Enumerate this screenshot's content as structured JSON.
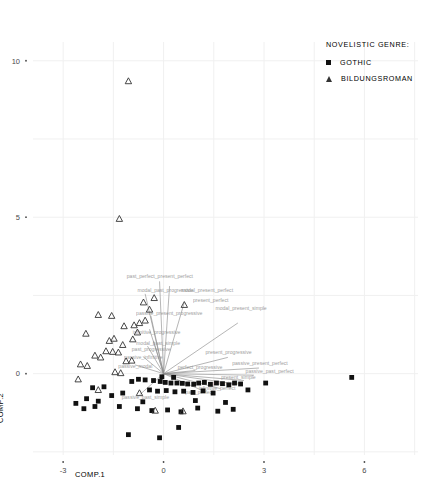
{
  "legend": {
    "title": "NOVELISTIC GENRE:",
    "entries": [
      {
        "label": "GOTHIC",
        "marker": "square-marker",
        "color": "#111111"
      },
      {
        "label": "BILDUNGSROMAN",
        "marker": "triangle-marker",
        "color": "#333333"
      }
    ]
  },
  "axes": {
    "xlabel": "COMP.1",
    "ylabel": "COMP.2",
    "xticks": [
      "-3",
      "0",
      "3",
      "6"
    ],
    "yticks": [
      "0",
      "5",
      "10"
    ]
  },
  "colors": {
    "gothic": "#111111",
    "bildungsroman": "#333333",
    "vector": "#8c8c8c",
    "grid": "#f0f0f0",
    "axis_text": "#4a4a4a"
  },
  "chart_data": {
    "type": "scatter",
    "title": "",
    "subtitle": "",
    "xlabel": "COMP.1",
    "ylabel": "COMP.2",
    "xlim": [
      -3.9,
      7.6
    ],
    "ylim": [
      -2.6,
      10.6
    ],
    "xticks": [
      -3,
      0,
      3,
      6
    ],
    "yticks": [
      0,
      5,
      10
    ],
    "grid": true,
    "legend_position": "top-right",
    "series": [
      {
        "name": "GOTHIC",
        "marker": "square",
        "color": "#111111",
        "points": [
          [
            -0.3,
            -0.22
          ],
          [
            -0.1,
            -0.25
          ],
          [
            0.05,
            -0.28
          ],
          [
            0.22,
            -0.3
          ],
          [
            0.4,
            -0.3
          ],
          [
            0.56,
            -0.31
          ],
          [
            0.72,
            -0.33
          ],
          [
            0.9,
            -0.34
          ],
          [
            1.05,
            -0.3
          ],
          [
            1.22,
            -0.28
          ],
          [
            1.4,
            -0.34
          ],
          [
            1.58,
            -0.3
          ],
          [
            1.76,
            -0.32
          ],
          [
            1.95,
            -0.36
          ],
          [
            2.12,
            -0.3
          ],
          [
            2.3,
            -0.33
          ],
          [
            -0.55,
            -0.2
          ],
          [
            -0.75,
            -0.18
          ],
          [
            -0.95,
            -0.25
          ],
          [
            -0.42,
            -0.52
          ],
          [
            -0.18,
            -0.56
          ],
          [
            0.08,
            -0.54
          ],
          [
            0.34,
            -0.58
          ],
          [
            0.6,
            -0.56
          ],
          [
            0.88,
            -0.6
          ],
          [
            1.18,
            -0.55
          ],
          [
            1.48,
            -0.62
          ],
          [
            -1.22,
            -0.62
          ],
          [
            -1.55,
            -0.7
          ],
          [
            -1.95,
            -0.88
          ],
          [
            -2.3,
            -0.8
          ],
          [
            -2.62,
            -0.95
          ],
          [
            -2.38,
            -1.12
          ],
          [
            -2.05,
            -1.05
          ],
          [
            -1.32,
            -1.05
          ],
          [
            -0.78,
            -1.12
          ],
          [
            -0.35,
            -1.18
          ],
          [
            0.12,
            -1.16
          ],
          [
            0.52,
            -1.22
          ],
          [
            1.02,
            -1.1
          ],
          [
            1.62,
            -1.2
          ],
          [
            2.08,
            -1.14
          ],
          [
            3.05,
            -0.3
          ],
          [
            5.62,
            -0.12
          ],
          [
            -1.05,
            -1.95
          ],
          [
            -0.12,
            -2.05
          ],
          [
            0.45,
            -1.72
          ],
          [
            -1.78,
            -0.42
          ],
          [
            -2.12,
            -0.45
          ],
          [
            -0.62,
            -0.9
          ],
          [
            0.95,
            -0.86
          ],
          [
            1.85,
            -0.92
          ],
          [
            2.52,
            -0.52
          ],
          [
            -0.05,
            -0.1
          ],
          [
            0.3,
            -0.12
          ]
        ]
      },
      {
        "name": "BILDUNGSROMAN",
        "marker": "triangle",
        "color": "#333333",
        "points": [
          [
            -1.05,
            9.35
          ],
          [
            -1.32,
            4.95
          ],
          [
            -0.28,
            2.42
          ],
          [
            -0.6,
            2.28
          ],
          [
            0.62,
            2.2
          ],
          [
            -1.95,
            1.88
          ],
          [
            -1.55,
            1.85
          ],
          [
            -1.18,
            1.52
          ],
          [
            -0.88,
            1.55
          ],
          [
            -0.72,
            1.62
          ],
          [
            -0.55,
            1.7
          ],
          [
            -2.32,
            1.28
          ],
          [
            -1.48,
            1.12
          ],
          [
            -1.62,
            1.05
          ],
          [
            -0.92,
            1.1
          ],
          [
            -1.72,
            0.72
          ],
          [
            -1.52,
            0.7
          ],
          [
            -1.35,
            0.68
          ],
          [
            -2.05,
            0.58
          ],
          [
            -1.88,
            0.52
          ],
          [
            -1.12,
            0.4
          ],
          [
            -0.95,
            0.42
          ],
          [
            -2.48,
            0.3
          ],
          [
            -2.28,
            0.25
          ],
          [
            -1.45,
            0.05
          ],
          [
            -1.28,
            0.02
          ],
          [
            -2.55,
            -0.18
          ],
          [
            -1.95,
            -0.52
          ],
          [
            -0.72,
            -0.62
          ],
          [
            -0.25,
            -1.18
          ],
          [
            0.58,
            -1.2
          ],
          [
            -0.42,
            2.05
          ],
          [
            -0.78,
            1.32
          ],
          [
            -1.22,
            0.92
          ]
        ]
      }
    ],
    "vectors": [
      {
        "label": "past_perfect_present_perfect",
        "dx": -0.12,
        "dy": 2.95,
        "label_dx": -1.1,
        "label_dy": 3.05
      },
      {
        "label": "modal_present_perfect",
        "dx": 0.18,
        "dy": 2.8,
        "label_dx": 0.52,
        "label_dy": 2.62
      },
      {
        "label": "modal_past_progressive",
        "dx": -0.55,
        "dy": 2.55,
        "label_dx": -0.78,
        "label_dy": 2.62
      },
      {
        "label": "present_perfect",
        "dx": 0.62,
        "dy": 2.28,
        "label_dx": 0.88,
        "label_dy": 2.3
      },
      {
        "label": "modal_present_simple",
        "dx": 2.22,
        "dy": 1.62,
        "label_dx": 1.55,
        "label_dy": 2.02
      },
      {
        "label": "passive_present_progressive",
        "dx": -0.38,
        "dy": 1.85,
        "label_dx": -0.82,
        "label_dy": 1.88
      },
      {
        "label": "infinitive_progressive",
        "dx": -0.42,
        "dy": 1.42,
        "label_dx": -0.92,
        "label_dy": 1.28
      },
      {
        "label": "modal_past_simple",
        "dx": -0.3,
        "dy": 1.05,
        "label_dx": -0.82,
        "label_dy": 0.92
      },
      {
        "label": "past_progressive",
        "dx": -0.48,
        "dy": 0.88,
        "label_dx": -0.95,
        "label_dy": 0.72
      },
      {
        "label": "present_progressive",
        "dx": 1.92,
        "dy": 0.52,
        "label_dx": 1.25,
        "label_dy": 0.62
      },
      {
        "label": "passive_present_perfect",
        "dx": 2.85,
        "dy": 0.18,
        "label_dx": 2.05,
        "label_dy": 0.28
      },
      {
        "label": "passive_past_perfect",
        "dx": 2.7,
        "dy": -0.05,
        "label_dx": 2.45,
        "label_dy": 0.02
      },
      {
        "label": "present_simple",
        "dx": 2.4,
        "dy": -0.22,
        "label_dx": 1.72,
        "label_dy": -0.18
      },
      {
        "label": "past_simple",
        "dx": 2.1,
        "dy": -0.32,
        "label_dx": 1.48,
        "label_dy": -0.36
      },
      {
        "label": "infinitive_perfect",
        "dx": 1.7,
        "dy": -0.48,
        "label_dx": 1.05,
        "label_dy": -0.52
      },
      {
        "label": "past_perfect",
        "dx": 1.25,
        "dy": -0.58,
        "label_dx": 0.65,
        "label_dy": -0.66
      },
      {
        "label": "passive_past_simple",
        "dx": -0.72,
        "dy": -0.68,
        "label_dx": -1.25,
        "label_dy": -0.8
      },
      {
        "label": "passive_modal",
        "dx": -0.85,
        "dy": 0.28,
        "label_dx": -1.35,
        "label_dy": 0.18
      },
      {
        "label": "passive_infinitive",
        "dx": -0.62,
        "dy": 0.55,
        "label_dx": -1.18,
        "label_dy": 0.48
      },
      {
        "label": "perfect_progressive",
        "dx": 0.95,
        "dy": 0.1,
        "label_dx": 0.42,
        "label_dy": 0.14
      }
    ]
  }
}
